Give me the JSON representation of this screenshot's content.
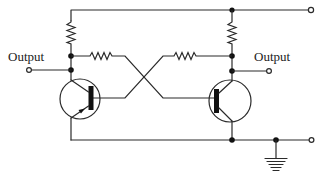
{
  "diagram": {
    "type": "circuit-schematic",
    "labels": {
      "left_output": "Output",
      "right_output": "Output"
    },
    "colors": {
      "line": "#2a2a2a",
      "junction": "#111111",
      "background": "#ffffff"
    },
    "components": [
      {
        "id": "R1",
        "kind": "resistor",
        "role": "left collector load"
      },
      {
        "id": "R2",
        "kind": "resistor",
        "role": "right collector load"
      },
      {
        "id": "R3",
        "kind": "resistor",
        "role": "cross-coupling left collector to right base"
      },
      {
        "id": "R4",
        "kind": "resistor",
        "role": "cross-coupling right collector to left base"
      },
      {
        "id": "Q1",
        "kind": "transistor",
        "role": "left transistor"
      },
      {
        "id": "Q2",
        "kind": "transistor",
        "role": "right transistor"
      },
      {
        "id": "GND",
        "kind": "ground"
      }
    ],
    "terminals": [
      {
        "id": "supply",
        "label": ""
      },
      {
        "id": "out-left",
        "label": "Output"
      },
      {
        "id": "out-right",
        "label": "Output"
      },
      {
        "id": "common",
        "label": ""
      }
    ]
  }
}
